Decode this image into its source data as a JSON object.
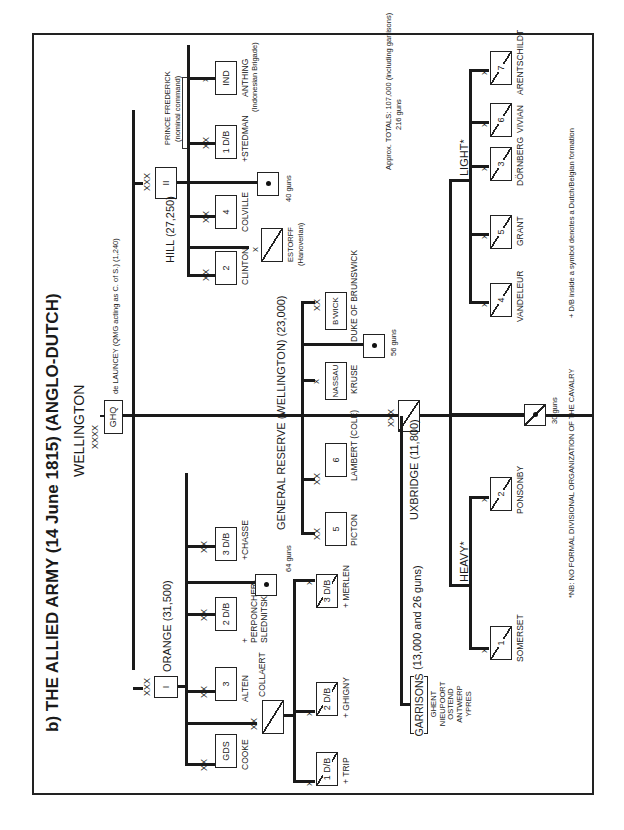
{
  "title": "b) THE ALLIED ARMY (14 June 1815) (ANGLO-DUTCH)",
  "commander": {
    "name": "WELLINGTON",
    "echelon": "XXXX",
    "hq_label": "GHQ",
    "staff_note": "de LAUNCEY (QMG acting as C. of S.) (1,240)"
  },
  "corps": [
    {
      "id": "I",
      "label": "ORANGE (31,500)",
      "echelon": "XXX",
      "units": [
        {
          "echelon": "XX",
          "symbol": "GDS",
          "commander": "COOKE",
          "type": "infantry"
        },
        {
          "echelon": "XX",
          "symbol": "3",
          "commander": "ALTEN",
          "type": "infantry"
        },
        {
          "echelon": "XX",
          "symbol": "2 D/B",
          "commander": "PERPONCHER-SLEDNITSKY",
          "prefix": "+",
          "type": "infantry"
        },
        {
          "echelon": "XX",
          "symbol": "3 D/B",
          "commander": "CHASSE",
          "prefix": "+",
          "type": "infantry"
        },
        {
          "symbol": "•",
          "commander": "64 guns",
          "type": "artillery"
        }
      ],
      "cavalry_division": {
        "echelon": "XX",
        "commander": "COLLAERT",
        "brigades": [
          {
            "echelon": "X",
            "symbol": "1 D/B",
            "commander": "TRIP",
            "prefix": "+"
          },
          {
            "echelon": "X",
            "symbol": "2 D/B",
            "commander": "GHIGNY",
            "prefix": "+"
          },
          {
            "echelon": "X",
            "symbol": "3 D/B",
            "commander": "MERLEN",
            "prefix": "+"
          }
        ]
      }
    },
    {
      "id": "II",
      "label": "HILL (27,250)",
      "echelon": "XXX",
      "units": [
        {
          "echelon": "XX",
          "symbol": "2",
          "commander": "CLINTON",
          "type": "infantry"
        },
        {
          "echelon": "X",
          "symbol": "",
          "commander": "ESTORFF",
          "note": "(Hanoverian)",
          "type": "cavalry"
        },
        {
          "echelon": "XX",
          "symbol": "4",
          "commander": "COLVILLE",
          "type": "infantry"
        },
        {
          "symbol": "•",
          "commander": "40 guns",
          "type": "artillery"
        },
        {
          "echelon": "XX",
          "symbol": "1 D/B",
          "commander": "STEDMAN",
          "prefix": "+",
          "type": "infantry"
        },
        {
          "echelon": "X",
          "symbol": "IND",
          "commander": "ANTHING",
          "note": "(Indonesian Brigade)",
          "type": "infantry"
        }
      ],
      "group_note": {
        "title": "PRINCE FREDERICK",
        "subtitle": "(nominal command)"
      }
    }
  ],
  "reserve": {
    "label": "GENERAL RESERVE (WELLINGTON) (23,000)",
    "units": [
      {
        "echelon": "XX",
        "symbol": "5",
        "commander": "PICTON"
      },
      {
        "echelon": "XX",
        "symbol": "6",
        "commander": "LAMBERT (COLE)"
      },
      {
        "echelon": "X",
        "symbol": "NASSAU",
        "commander": "KRUSE"
      },
      {
        "symbol": "•",
        "commander": "56 guns",
        "type": "artillery"
      },
      {
        "echelon": "XX",
        "symbol": "B'WICK",
        "commander": "DUKE OF BRUNSWICK"
      }
    ]
  },
  "cavalry_corps": {
    "label": "UXBRIDGE (11,800)",
    "echelon": "XXX",
    "heavy": {
      "label": "HEAVY*",
      "brigades": [
        {
          "echelon": "X",
          "symbol": "1",
          "commander": "SOMERSET"
        },
        {
          "echelon": "X",
          "symbol": "2",
          "commander": "PONSONBY"
        }
      ]
    },
    "light": {
      "label": "LIGHT*",
      "brigades": [
        {
          "echelon": "X",
          "symbol": "4",
          "commander": "VANDELEUR"
        },
        {
          "echelon": "X",
          "symbol": "5",
          "commander": "GRANT"
        },
        {
          "echelon": "X",
          "symbol": "3",
          "commander": "DÖRNBERG"
        },
        {
          "echelon": "X",
          "symbol": "6",
          "commander": "VIVIAN"
        },
        {
          "echelon": "X",
          "symbol": "7",
          "commander": "ARENTSCHILDT"
        }
      ]
    },
    "artillery": {
      "symbol": "•",
      "label": "30 guns"
    }
  },
  "garrisons": {
    "label": "GARRISONS",
    "strength": "(13,000 and 26 guns)",
    "towns": [
      "GHENT",
      "NIEUPOORT",
      "OSTEND",
      "ANTWERP",
      "YPRES"
    ]
  },
  "totals": {
    "line1": "Approx. TOTALS: 107,000 (including garrisons)",
    "line2": "216 guns"
  },
  "footnotes": {
    "cavalry": "*NB: NO FORMAL DIVISIONAL ORGANIZATION OF THE CAVALRY",
    "dutch_belgian": "+ D/B inside a symbol denotes a Dutch/Belgian formation"
  }
}
